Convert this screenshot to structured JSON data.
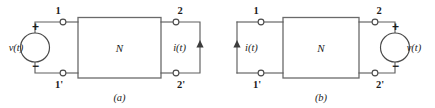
{
  "figure": {
    "background_color": "#ffffff",
    "line_color": "#5f5f5f",
    "text_color": "#1c1c1c",
    "panels": [
      {
        "caption": "(a)",
        "network_label": "N",
        "terminals": {
          "top_left": "1",
          "bottom_left": "1'",
          "top_right": "2",
          "bottom_right": "2'"
        },
        "source": {
          "side": "left",
          "type": "voltage-source",
          "label": "v(t)",
          "label_side": "left",
          "plus": "+",
          "minus": "−"
        },
        "current": {
          "side": "right",
          "label": "i(t)",
          "direction": "up"
        }
      },
      {
        "caption": "(b)",
        "network_label": "N",
        "terminals": {
          "top_left": "1",
          "bottom_left": "1'",
          "top_right": "2",
          "bottom_right": "2'"
        },
        "source": {
          "side": "right",
          "type": "voltage-source",
          "label": "v(t)",
          "label_side": "right",
          "plus": "+",
          "minus": "−"
        },
        "current": {
          "side": "left",
          "label": "i(t)",
          "direction": "up"
        }
      }
    ]
  }
}
